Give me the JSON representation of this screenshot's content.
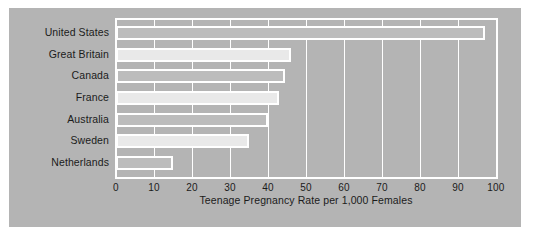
{
  "chart_data": {
    "type": "bar",
    "orientation": "horizontal",
    "title": "",
    "xlabel": "Teenage Pregnancy Rate per 1,000 Females",
    "ylabel": "",
    "categories": [
      "United States",
      "Great Britain",
      "Canada",
      "France",
      "Australia",
      "Sweden",
      "Netherlands"
    ],
    "values": [
      97,
      46,
      44.5,
      43,
      40,
      35,
      15
    ],
    "xlim": [
      0,
      100
    ],
    "xticks": [
      0,
      10,
      20,
      30,
      40,
      50,
      60,
      70,
      80,
      90,
      100
    ],
    "xtick_labels": [
      "0",
      "10",
      "20",
      "30",
      "40",
      "50",
      "60",
      "70",
      "80",
      "90",
      "100"
    ],
    "grid": "vertical",
    "legend": "none",
    "bar_colors": [
      "#bcbcbc",
      "#e9e9e9",
      "#bcbcbc",
      "#e9e9e9",
      "#bcbcbc",
      "#e9e9e9",
      "#bcbcbc"
    ],
    "bar_edge_color": "#ffffff",
    "panel_color": "#b4b4b4",
    "axis_color": "#ffffff",
    "text_color": "#1b1b1b"
  }
}
